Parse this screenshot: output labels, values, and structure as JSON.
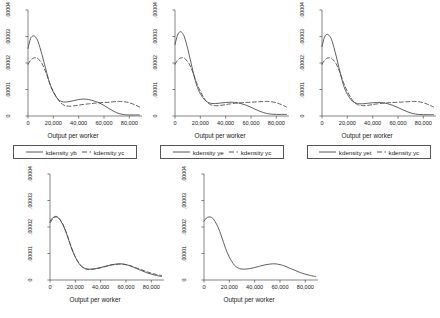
{
  "chart_data": [
    {
      "panel_id": "panel-1",
      "type": "line",
      "title": "",
      "xlabel": "Output per worker",
      "ylabel": "",
      "xlim": [
        0,
        90000
      ],
      "ylim": [
        0,
        4e-05
      ],
      "grid": false,
      "legend_position": "below",
      "xticks": [
        0,
        20000,
        40000,
        60000,
        80000
      ],
      "xticklabels": [
        "0",
        "20,000",
        "40,000",
        "60,000",
        "80,000"
      ],
      "yticks": [
        0,
        1e-05,
        2e-05,
        3e-05,
        4e-05
      ],
      "yticklabels": [
        "0",
        ".00001",
        ".00002",
        ".00003",
        ".00004"
      ],
      "series": [
        {
          "name": "kdensity yb",
          "style": "solid",
          "color": "#444444",
          "x": [
            0,
            2000,
            4000,
            6000,
            8000,
            11000,
            14000,
            17000,
            20000,
            24000,
            28000,
            32000,
            36000,
            40000,
            44000,
            48000,
            52000,
            56000,
            60000,
            64000,
            68000,
            72000,
            76000,
            80000,
            84000,
            88000
          ],
          "y": [
            2.55e-05,
            2.92e-05,
            3.02e-05,
            2.98e-05,
            2.8e-05,
            2.32e-05,
            1.78e-05,
            1.25e-05,
            9e-06,
            6.2e-06,
            5.3e-06,
            5.4e-06,
            5.8e-06,
            6.2e-06,
            6.4e-06,
            6.2e-06,
            5.7e-06,
            5e-06,
            4e-06,
            2.8e-06,
            1.7e-06,
            9e-07,
            5e-07,
            4e-07,
            4e-07,
            4e-07
          ]
        },
        {
          "name": "kdensity yc",
          "style": "dashed",
          "color": "#444444",
          "x": [
            0,
            2000,
            4000,
            6000,
            8000,
            11000,
            14000,
            17000,
            20000,
            24000,
            28000,
            32000,
            36000,
            40000,
            44000,
            48000,
            52000,
            56000,
            60000,
            64000,
            68000,
            72000,
            76000,
            80000,
            84000,
            88000
          ],
          "y": [
            1.95e-05,
            2.1e-05,
            2.18e-05,
            2.2e-05,
            2.16e-05,
            1.98e-05,
            1.66e-05,
            1.26e-05,
            9.3e-06,
            6e-06,
            4.2e-06,
            3.7e-06,
            3.8e-06,
            4.1e-06,
            4.4e-06,
            4.6e-06,
            4.8e-06,
            5e-06,
            5.1e-06,
            5.2e-06,
            5.4e-06,
            5.5e-06,
            5.4e-06,
            5e-06,
            4.3e-06,
            3.4e-06
          ]
        }
      ]
    },
    {
      "panel_id": "panel-2",
      "type": "line",
      "title": "",
      "xlabel": "Output per worker",
      "ylabel": "",
      "xlim": [
        0,
        90000
      ],
      "ylim": [
        0,
        4e-05
      ],
      "grid": false,
      "legend_position": "below",
      "xticks": [
        0,
        20000,
        40000,
        60000,
        80000
      ],
      "xticklabels": [
        "0",
        "20,000",
        "40,000",
        "60,000",
        "80,000"
      ],
      "yticks": [
        0,
        1e-05,
        2e-05,
        3e-05,
        4e-05
      ],
      "yticklabels": [
        "0",
        ".00001",
        ".00002",
        ".00003",
        ".00004"
      ],
      "series": [
        {
          "name": "kdensity ye",
          "style": "solid",
          "color": "#444444",
          "x": [
            0,
            2000,
            4000,
            6000,
            8000,
            11000,
            14000,
            17000,
            20000,
            24000,
            28000,
            32000,
            36000,
            40000,
            44000,
            48000,
            52000,
            56000,
            60000,
            64000,
            68000,
            72000,
            76000,
            80000,
            84000,
            88000
          ],
          "y": [
            2.7e-05,
            3.05e-05,
            3.18e-05,
            3.12e-05,
            2.9e-05,
            2.35e-05,
            1.72e-05,
            1.18e-05,
            8.4e-06,
            5.8e-06,
            4.8e-06,
            4.7e-06,
            4.9e-06,
            5.1e-06,
            5.2e-06,
            5.1e-06,
            4.7e-06,
            4.1e-06,
            3.3e-06,
            2.4e-06,
            1.6e-06,
            1e-06,
            7e-07,
            6e-07,
            6e-07,
            6e-07
          ]
        },
        {
          "name": "kdensity yc",
          "style": "dashed",
          "color": "#444444",
          "x": [
            0,
            2000,
            4000,
            6000,
            8000,
            11000,
            14000,
            17000,
            20000,
            24000,
            28000,
            32000,
            36000,
            40000,
            44000,
            48000,
            52000,
            56000,
            60000,
            64000,
            68000,
            72000,
            76000,
            80000,
            84000,
            88000
          ],
          "y": [
            1.95e-05,
            2.1e-05,
            2.18e-05,
            2.2e-05,
            2.16e-05,
            1.98e-05,
            1.66e-05,
            1.26e-05,
            9.3e-06,
            6e-06,
            4.3e-06,
            3.9e-06,
            4e-06,
            4.3e-06,
            4.6e-06,
            4.8e-06,
            5e-06,
            5.1e-06,
            5.2e-06,
            5.3e-06,
            5.4e-06,
            5.5e-06,
            5.4e-06,
            5e-06,
            4.3e-06,
            3.4e-06
          ]
        }
      ]
    },
    {
      "panel_id": "panel-3",
      "type": "line",
      "title": "",
      "xlabel": "Output per worker",
      "ylabel": "",
      "xlim": [
        0,
        90000
      ],
      "ylim": [
        0,
        4e-05
      ],
      "grid": false,
      "legend_position": "below",
      "xticks": [
        0,
        20000,
        40000,
        60000,
        80000
      ],
      "xticklabels": [
        "0",
        "20,000",
        "40,000",
        "60,000",
        "80,000"
      ],
      "yticks": [
        0,
        1e-05,
        2e-05,
        3e-05,
        4e-05
      ],
      "yticklabels": [
        "0",
        ".00001",
        ".00002",
        ".00003",
        ".00004"
      ],
      "series": [
        {
          "name": "kdensity yet",
          "style": "solid",
          "color": "#444444",
          "x": [
            0,
            2000,
            4000,
            6000,
            8000,
            11000,
            14000,
            17000,
            20000,
            24000,
            28000,
            32000,
            36000,
            40000,
            44000,
            48000,
            52000,
            56000,
            60000,
            64000,
            68000,
            72000,
            76000,
            80000,
            84000,
            88000
          ],
          "y": [
            2.62e-05,
            2.98e-05,
            3.08e-05,
            3.02e-05,
            2.82e-05,
            2.3e-05,
            1.7e-05,
            1.16e-05,
            8.2e-06,
            5.6e-06,
            4.7e-06,
            4.6e-06,
            4.8e-06,
            5e-06,
            5.1e-06,
            5e-06,
            4.6e-06,
            4e-06,
            3.2e-06,
            2.3e-06,
            1.5e-06,
            9e-07,
            6e-07,
            5e-07,
            5e-07,
            5e-07
          ]
        },
        {
          "name": "kdensity yc",
          "style": "dashed",
          "color": "#444444",
          "x": [
            0,
            2000,
            4000,
            6000,
            8000,
            11000,
            14000,
            17000,
            20000,
            24000,
            28000,
            32000,
            36000,
            40000,
            44000,
            48000,
            52000,
            56000,
            60000,
            64000,
            68000,
            72000,
            76000,
            80000,
            84000,
            88000
          ],
          "y": [
            1.95e-05,
            2.1e-05,
            2.18e-05,
            2.2e-05,
            2.16e-05,
            1.98e-05,
            1.66e-05,
            1.26e-05,
            9.3e-06,
            6e-06,
            4.3e-06,
            3.9e-06,
            4e-06,
            4.3e-06,
            4.6e-06,
            4.8e-06,
            5e-06,
            5.1e-06,
            5.2e-06,
            5.3e-06,
            5.4e-06,
            5.5e-06,
            5.4e-06,
            5e-06,
            4.3e-06,
            3.4e-06
          ]
        }
      ]
    },
    {
      "panel_id": "panel-4",
      "type": "line",
      "title": "",
      "xlabel": "Output per worker",
      "ylabel": "",
      "xlim": [
        0,
        90000
      ],
      "ylim": [
        0,
        4e-05
      ],
      "grid": false,
      "legend_position": "none",
      "xticks": [
        0,
        20000,
        40000,
        60000,
        80000
      ],
      "xticklabels": [
        "0",
        "20,000",
        "40,000",
        "60,000",
        "80,000"
      ],
      "yticks": [
        0,
        1e-05,
        2e-05,
        3e-05,
        4e-05
      ],
      "yticklabels": [
        "0",
        ".00001",
        ".00002",
        ".00003",
        ".00004"
      ],
      "series": [
        {
          "name": "series-solid",
          "style": "solid",
          "color": "#444444",
          "x": [
            0,
            2000,
            4000,
            6000,
            8000,
            11000,
            14000,
            17000,
            20000,
            24000,
            28000,
            32000,
            36000,
            40000,
            44000,
            48000,
            52000,
            56000,
            60000,
            64000,
            68000,
            72000,
            76000,
            80000,
            84000,
            88000
          ],
          "y": [
            2.22e-05,
            2.34e-05,
            2.38e-05,
            2.36e-05,
            2.26e-05,
            2e-05,
            1.62e-05,
            1.2e-05,
            8.6e-06,
            5.6e-06,
            4.3e-06,
            4.1e-06,
            4.3e-06,
            4.7e-06,
            5.2e-06,
            5.7e-06,
            6e-06,
            6.1e-06,
            5.8e-06,
            5.2e-06,
            4.4e-06,
            3.6e-06,
            2.8e-06,
            2.2e-06,
            1.7e-06,
            1.3e-06
          ]
        },
        {
          "name": "series-dashed",
          "style": "dashed",
          "color": "#444444",
          "x": [
            0,
            2000,
            4000,
            6000,
            8000,
            11000,
            14000,
            17000,
            20000,
            24000,
            28000,
            32000,
            36000,
            40000,
            44000,
            48000,
            52000,
            56000,
            60000,
            64000,
            68000,
            72000,
            76000,
            80000,
            84000,
            88000
          ],
          "y": [
            2.16e-05,
            2.3e-05,
            2.4e-05,
            2.38e-05,
            2.28e-05,
            2.02e-05,
            1.64e-05,
            1.21e-05,
            8.7e-06,
            5.6e-06,
            4.2e-06,
            4e-06,
            4.2e-06,
            4.6e-06,
            5.1e-06,
            5.6e-06,
            5.9e-06,
            6e-06,
            5.8e-06,
            5.3e-06,
            4.6e-06,
            3.9e-06,
            3.2e-06,
            2.6e-06,
            2.1e-06,
            1.7e-06
          ]
        }
      ]
    },
    {
      "panel_id": "panel-5",
      "type": "line",
      "title": "",
      "xlabel": "Output per worker",
      "ylabel": "",
      "xlim": [
        0,
        90000
      ],
      "ylim": [
        0,
        4e-05
      ],
      "grid": false,
      "legend_position": "none",
      "xticks": [
        0,
        20000,
        40000,
        60000,
        80000
      ],
      "xticklabels": [
        "0",
        "20,000",
        "40,000",
        "60,000",
        "80,000"
      ],
      "yticks": [
        0,
        1e-05,
        2e-05,
        3e-05,
        4e-05
      ],
      "yticklabels": [
        "0",
        ".00001",
        ".00002",
        ".00003",
        ".00004"
      ],
      "series": [
        {
          "name": "series-solid",
          "style": "solid",
          "color": "#444444",
          "x": [
            0,
            2000,
            4000,
            6000,
            8000,
            11000,
            14000,
            17000,
            20000,
            24000,
            28000,
            32000,
            36000,
            40000,
            44000,
            48000,
            52000,
            56000,
            60000,
            64000,
            68000,
            72000,
            76000,
            80000,
            84000,
            88000
          ],
          "y": [
            2.22e-05,
            2.34e-05,
            2.38e-05,
            2.36e-05,
            2.26e-05,
            2e-05,
            1.62e-05,
            1.2e-05,
            8.6e-06,
            5.6e-06,
            4.3e-06,
            4.1e-06,
            4.3e-06,
            4.7e-06,
            5.2e-06,
            5.7e-06,
            6e-06,
            6.1e-06,
            5.8e-06,
            5.2e-06,
            4.4e-06,
            3.6e-06,
            2.8e-06,
            2.2e-06,
            1.7e-06,
            1.3e-06
          ]
        }
      ]
    }
  ]
}
